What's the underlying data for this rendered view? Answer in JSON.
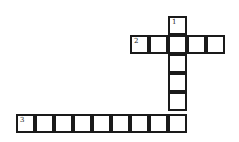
{
  "puzzle": {
    "type": "crossword",
    "cell_size": 19,
    "cells": [
      {
        "x": 168,
        "y": 16,
        "number": "1"
      },
      {
        "x": 130,
        "y": 35,
        "number": "2"
      },
      {
        "x": 149,
        "y": 35,
        "number": null
      },
      {
        "x": 168,
        "y": 35,
        "number": null
      },
      {
        "x": 187,
        "y": 35,
        "number": null
      },
      {
        "x": 206,
        "y": 35,
        "number": null
      },
      {
        "x": 168,
        "y": 54,
        "number": null
      },
      {
        "x": 168,
        "y": 73,
        "number": null
      },
      {
        "x": 168,
        "y": 92,
        "number": null
      },
      {
        "x": 16,
        "y": 114,
        "number": "3"
      },
      {
        "x": 35,
        "y": 114,
        "number": null
      },
      {
        "x": 54,
        "y": 114,
        "number": null
      },
      {
        "x": 73,
        "y": 114,
        "number": null
      },
      {
        "x": 92,
        "y": 114,
        "number": null
      },
      {
        "x": 111,
        "y": 114,
        "number": null
      },
      {
        "x": 130,
        "y": 114,
        "number": null
      },
      {
        "x": 149,
        "y": 114,
        "number": null
      },
      {
        "x": 168,
        "y": 114,
        "number": null
      }
    ],
    "words": [
      {
        "number": "1",
        "direction": "down",
        "length": 6
      },
      {
        "number": "2",
        "direction": "across",
        "length": 5
      },
      {
        "number": "3",
        "direction": "across",
        "length": 9
      }
    ],
    "colors": {
      "border": "#1a1a1a",
      "background": "#ffffff"
    }
  }
}
